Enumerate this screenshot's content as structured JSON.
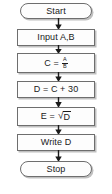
{
  "diagram": {
    "type": "flowchart",
    "background_color": "#ffffff",
    "border_color": "#6e6e6e",
    "text_color": "#1a1a1a",
    "shadow_color": "#8c8c8c",
    "nodes": [
      {
        "id": "start",
        "shape": "terminator",
        "label": "Start"
      },
      {
        "id": "input",
        "shape": "process",
        "label": "Input A,B"
      },
      {
        "id": "divide",
        "shape": "process",
        "label": "C =",
        "expression": "C = A/B",
        "numerator": "A",
        "denominator": "B"
      },
      {
        "id": "add",
        "shape": "process",
        "label": "D = C + 30"
      },
      {
        "id": "sqrt",
        "shape": "process",
        "label": "E =",
        "expression": "E = √D",
        "radical_sign": "√",
        "radicand": "D"
      },
      {
        "id": "write",
        "shape": "process",
        "label": "Write D"
      },
      {
        "id": "stop",
        "shape": "terminator",
        "label": "Stop"
      }
    ],
    "connectors": [
      {
        "id": "conn-1",
        "from": "start",
        "to": "input",
        "arrow": "down"
      },
      {
        "id": "conn-2",
        "from": "input",
        "to": "divide",
        "arrow": "down"
      },
      {
        "id": "conn-3",
        "from": "divide",
        "to": "add",
        "arrow": "down"
      },
      {
        "id": "conn-4",
        "from": "add",
        "to": "sqrt",
        "arrow": "down"
      },
      {
        "id": "conn-5",
        "from": "sqrt",
        "to": "write",
        "arrow": "down"
      },
      {
        "id": "conn-6",
        "from": "write",
        "to": "stop",
        "arrow": "down"
      }
    ]
  }
}
